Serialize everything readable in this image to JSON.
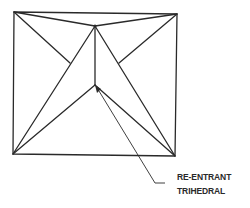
{
  "diagram": {
    "type": "geometric-line-drawing",
    "colors": {
      "line": "#2a2a2a",
      "background": "#ffffff"
    },
    "vertices": {
      "top_left": [
        14,
        12
      ],
      "top_right": [
        177,
        14
      ],
      "bottom_left": [
        13,
        154
      ],
      "bottom_right": [
        175,
        156
      ],
      "apex": [
        95,
        26
      ],
      "inner": [
        95,
        85
      ],
      "left_stub_end": [
        70,
        63
      ],
      "right_stub_end": [
        119,
        63
      ]
    },
    "annotation": {
      "lines": [
        "RE-ENTRANT",
        "TRIHEDRAL"
      ],
      "leader_start": [
        96,
        86
      ],
      "leader_bend": [
        155,
        183
      ],
      "leader_end": [
        165,
        183
      ]
    }
  }
}
